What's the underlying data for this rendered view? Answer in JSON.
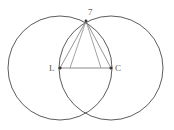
{
  "figure": {
    "canvas": {
      "width": 174,
      "height": 130,
      "background": "#ffffff"
    },
    "stroke": {
      "circle_color": "#4a4a4a",
      "triangle_color": "#8a8a8a",
      "chord_color": "#8a8a8a",
      "point_color": "#3a3a3a",
      "circle_width": 0.9,
      "line_width": 0.9
    },
    "circles": [
      {
        "name": "circle-left",
        "cx": 60,
        "cy": 68,
        "r": 52
      },
      {
        "name": "circle-right",
        "cx": 111,
        "cy": 68,
        "r": 52
      }
    ],
    "points": [
      {
        "id": "apex",
        "label": "7",
        "x": 86,
        "y": 21,
        "label_dx": 2,
        "label_dy": -11,
        "dot": true
      },
      {
        "id": "left-center",
        "label": "L",
        "x": 60,
        "y": 68,
        "label_dx": -9,
        "label_dy": 0,
        "dot": true
      },
      {
        "id": "right-center",
        "label": "C",
        "x": 111,
        "y": 68,
        "label_dx": 4,
        "label_dy": 0,
        "dot": true
      },
      {
        "id": "bottom",
        "label": "",
        "x": 86,
        "y": 116,
        "label_dx": 0,
        "label_dy": 0,
        "dot": false
      }
    ],
    "segments": [
      {
        "id": "base",
        "name": "segment-base",
        "x1": 60,
        "y1": 68,
        "x2": 111,
        "y2": 68
      },
      {
        "id": "left-side",
        "name": "segment-left-side",
        "x1": 60,
        "y1": 68,
        "x2": 86,
        "y2": 21
      },
      {
        "id": "right-side",
        "name": "segment-right-side",
        "x1": 111,
        "y1": 68,
        "x2": 86,
        "y2": 21
      },
      {
        "id": "chord-left",
        "name": "segment-chord-left",
        "x1": 86,
        "y1": 21,
        "x2": 70,
        "y2": 68
      },
      {
        "id": "chord-right",
        "name": "segment-chord-right",
        "x1": 86,
        "y1": 21,
        "x2": 101,
        "y2": 68
      }
    ],
    "labels": {
      "apex": "7",
      "left": "L",
      "right": "C"
    }
  }
}
